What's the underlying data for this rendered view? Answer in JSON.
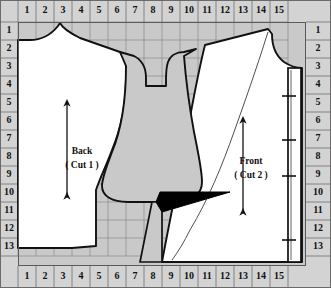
{
  "diagram": {
    "grid": {
      "columns": [
        "1",
        "2",
        "3",
        "4",
        "5",
        "6",
        "7",
        "8",
        "9",
        "10",
        "11",
        "12",
        "13",
        "14",
        "15"
      ],
      "rows": [
        "1",
        "2",
        "3",
        "4",
        "5",
        "6",
        "7",
        "8",
        "9",
        "10",
        "11",
        "12",
        "13"
      ],
      "cell_size_px": 18,
      "origin_x_px": 18,
      "origin_y_px": 22,
      "grid_line_color": "#7d7d7d",
      "ruler_bg_color": "#d3d3d3",
      "ruler_text_color": "#141414",
      "fabric_fill_color": "#c9c9c9",
      "piece_fill_color": "#ffffff",
      "outline_color": "#111111",
      "dart_fill_color": "#000000"
    },
    "rulers": {
      "top": [
        "1",
        "2",
        "3",
        "4",
        "5",
        "6",
        "7",
        "8",
        "9",
        "10",
        "11",
        "12",
        "13",
        "14",
        "15"
      ],
      "bottom": [
        "1",
        "2",
        "3",
        "4",
        "5",
        "6",
        "7",
        "8",
        "9",
        "10",
        "11",
        "12",
        "13",
        "14",
        "15"
      ],
      "left": [
        "1",
        "2",
        "3",
        "4",
        "5",
        "6",
        "7",
        "8",
        "9",
        "10",
        "11",
        "12",
        "13"
      ],
      "right": [
        "1",
        "2",
        "3",
        "4",
        "5",
        "6",
        "7",
        "8",
        "9",
        "10",
        "11",
        "12",
        "13"
      ]
    },
    "pieces": [
      {
        "id": "back",
        "name": "Back",
        "cut_label": "( Cut 1 )",
        "grainline": "vertical-double-arrow",
        "label_x_px": 82,
        "label_y_px": 155
      },
      {
        "id": "front",
        "name": "Front",
        "cut_label": "( Cut 2 )",
        "grainline": "vertical-double-arrow",
        "label_x_px": 251,
        "label_y_px": 165
      }
    ],
    "annotations": {
      "dart": "black-filled-triangle",
      "facing_strip": "narrow-vertical-band-with-notches",
      "facing_notch_count": 4
    }
  }
}
